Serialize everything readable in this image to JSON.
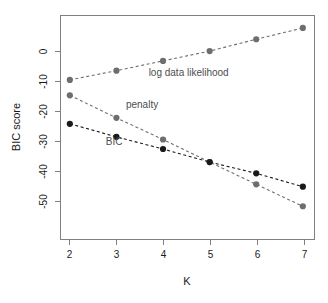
{
  "chart_data": {
    "type": "line",
    "title": "",
    "xlabel": "K",
    "ylabel": "BIC score",
    "x": [
      2,
      3,
      4,
      5,
      6,
      7
    ],
    "xticklabels": [
      "2",
      "3",
      "4",
      "5",
      "6",
      "7"
    ],
    "yticks": [
      0,
      -10,
      -20,
      -30,
      -40,
      -50
    ],
    "yticklabels": [
      "0",
      "-10",
      "-20",
      "-30",
      "-40",
      "-50"
    ],
    "xlim": [
      1.8,
      7.25
    ],
    "ylim": [
      -63.5,
      12
    ],
    "grid": false,
    "legend_position": "inline-annotations",
    "series": [
      {
        "name": "log data likelihood",
        "color": "#6e6e6e",
        "marker": "circle",
        "linestyle": "dashed",
        "values": [
          -9.7,
          -6.6,
          -3.3,
          0.0,
          4.0,
          7.8
        ]
      },
      {
        "name": "penalty",
        "color": "#6e6e6e",
        "marker": "circle",
        "linestyle": "dashed",
        "values": [
          -14.9,
          -22.5,
          -29.8,
          -37.4,
          -44.9,
          -52.3
        ]
      },
      {
        "name": "BIC",
        "color": "#1a1a1a",
        "marker": "circle",
        "linestyle": "dashed",
        "values": [
          -24.5,
          -28.9,
          -33.0,
          -37.4,
          -41.2,
          -45.7
        ]
      }
    ],
    "annotations": [
      {
        "text": "log data likelihood",
        "x": 4.55,
        "y": -8.5,
        "color": "#6e6e6e"
      },
      {
        "text": "penalty",
        "x": 3.55,
        "y": -19.3,
        "color": "#4d4d4d"
      },
      {
        "text": "BIC",
        "x": 2.95,
        "y": -31.8,
        "color": "#1a1a1a"
      }
    ]
  },
  "axes": {
    "y_title": "BIC score",
    "x_title": "K"
  }
}
